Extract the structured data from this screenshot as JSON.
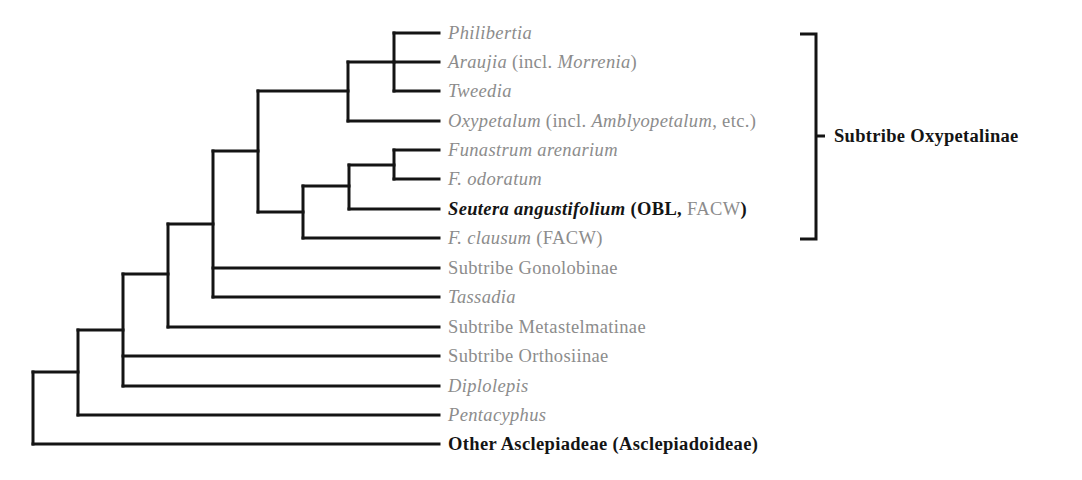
{
  "figure": {
    "type": "cladogram",
    "line_color": "#141414",
    "label_gray": "#8c8c8c",
    "label_dark": "#141414"
  },
  "leaves": [
    {
      "id": "philibertia",
      "y": 33,
      "parts": [
        {
          "t": "Philibertia",
          "i": true
        }
      ]
    },
    {
      "id": "araujia",
      "y": 62,
      "parts": [
        {
          "t": "Araujia",
          "i": true
        },
        {
          "t": " (incl. "
        },
        {
          "t": "Morrenia",
          "i": true
        },
        {
          "t": ")"
        }
      ]
    },
    {
      "id": "tweedia",
      "y": 91,
      "parts": [
        {
          "t": "Tweedia",
          "i": true
        }
      ]
    },
    {
      "id": "oxypetalum",
      "y": 121,
      "parts": [
        {
          "t": "Oxypetalum",
          "i": true
        },
        {
          "t": " (incl. "
        },
        {
          "t": "Amblyopetalum",
          "i": true
        },
        {
          "t": ", etc.)"
        }
      ]
    },
    {
      "id": "funastrum-arenarium",
      "y": 150,
      "parts": [
        {
          "t": "Funastrum arenarium",
          "i": true
        }
      ]
    },
    {
      "id": "f-odoratum",
      "y": 179,
      "parts": [
        {
          "t": "F. odoratum",
          "i": true
        }
      ]
    },
    {
      "id": "seutera-angustifolium",
      "y": 209,
      "parts": [
        {
          "t": "Seutera angustifolium",
          "i": true,
          "d": true
        },
        {
          "t": " (",
          "d": true
        },
        {
          "t": "OBL,",
          "d": true
        },
        {
          "t": " FACW"
        },
        {
          "t": ")",
          "d": true
        }
      ]
    },
    {
      "id": "f-clausum",
      "y": 238,
      "parts": [
        {
          "t": "F. clausum",
          "i": true
        },
        {
          "t": " (FACW)"
        }
      ]
    },
    {
      "id": "gonolobinae",
      "y": 268,
      "parts": [
        {
          "t": "Subtribe Gonolobinae"
        }
      ]
    },
    {
      "id": "tassadia",
      "y": 297,
      "parts": [
        {
          "t": "Tassadia",
          "i": true
        }
      ]
    },
    {
      "id": "metastelmatinae",
      "y": 327,
      "parts": [
        {
          "t": "Subtribe Metastelmatinae"
        }
      ]
    },
    {
      "id": "orthosiinae",
      "y": 356,
      "parts": [
        {
          "t": "Subtribe Orthosiinae"
        }
      ]
    },
    {
      "id": "diplolepis",
      "y": 386,
      "parts": [
        {
          "t": "Diplolepis",
          "i": true
        }
      ]
    },
    {
      "id": "pentacyphus",
      "y": 415,
      "parts": [
        {
          "t": "Pentacyphus",
          "i": true
        }
      ]
    },
    {
      "id": "other-asclepiadeae",
      "y": 444,
      "parts": [
        {
          "t": "Other Asclepiadeae (Asclepiadoideae)",
          "d": true
        }
      ]
    }
  ],
  "branches": [
    [
      394,
      33,
      439,
      33
    ],
    [
      394,
      62,
      439,
      62
    ],
    [
      394,
      91,
      439,
      91
    ],
    [
      394,
      33,
      394,
      91
    ],
    [
      348,
      62,
      394,
      62
    ],
    [
      348,
      121,
      439,
      121
    ],
    [
      348,
      62,
      348,
      121
    ],
    [
      258,
      91,
      348,
      91
    ],
    [
      394,
      150,
      439,
      150
    ],
    [
      394,
      179,
      439,
      179
    ],
    [
      394,
      150,
      394,
      179
    ],
    [
      349,
      165,
      394,
      165
    ],
    [
      349,
      209,
      439,
      209
    ],
    [
      349,
      165,
      349,
      209
    ],
    [
      303,
      186,
      349,
      186
    ],
    [
      303,
      238,
      439,
      238
    ],
    [
      303,
      186,
      303,
      238
    ],
    [
      258,
      212,
      303,
      212
    ],
    [
      258,
      91,
      258,
      212
    ],
    [
      213,
      151,
      258,
      151
    ],
    [
      213,
      268,
      439,
      268
    ],
    [
      213,
      297,
      439,
      297
    ],
    [
      213,
      151,
      213,
      297
    ],
    [
      168,
      224,
      213,
      224
    ],
    [
      168,
      327,
      439,
      327
    ],
    [
      168,
      224,
      168,
      327
    ],
    [
      123,
      274,
      168,
      274
    ],
    [
      123,
      356,
      439,
      356
    ],
    [
      123,
      386,
      439,
      386
    ],
    [
      123,
      274,
      123,
      386
    ],
    [
      78,
      330,
      123,
      330
    ],
    [
      78,
      415,
      439,
      415
    ],
    [
      78,
      330,
      78,
      415
    ],
    [
      33,
      372,
      78,
      372
    ],
    [
      33,
      444,
      439,
      444
    ],
    [
      33,
      372,
      33,
      444
    ]
  ],
  "bracket": {
    "x_inner": 800,
    "x_spine": 816,
    "y_top": 34,
    "y_bottom": 239,
    "tick_y": 136,
    "tick_x_end": 825,
    "label": "Subtribe Oxypetalinae"
  }
}
